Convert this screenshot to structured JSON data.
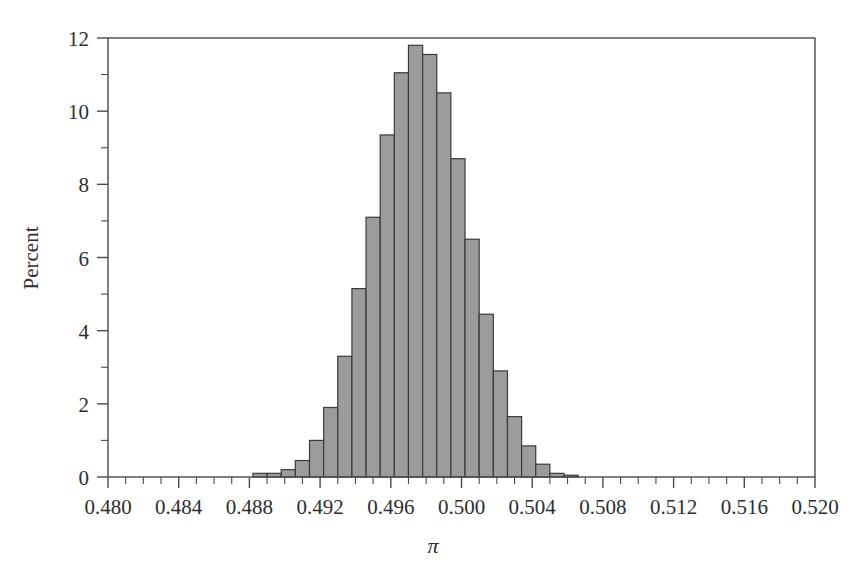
{
  "figure": {
    "background_color": "#ffffff",
    "plot_frame_color": "#4a4a4a",
    "bar_fill_color": "#9c9c9c",
    "bar_edge_color": "#3a3a3a",
    "text_color": "#2e2e2e"
  },
  "chart_data": {
    "type": "bar",
    "title": "",
    "subtitle": "",
    "xlabel": "π",
    "ylabel": "Percent",
    "xlim": [
      0.48,
      0.52
    ],
    "ylim": [
      0,
      12.2
    ],
    "grid": false,
    "legend": null,
    "bin_width": 0.0008,
    "x_major_ticks": [
      0.48,
      0.484,
      0.488,
      0.492,
      0.496,
      0.5,
      0.504,
      0.508,
      0.512,
      0.516,
      0.52
    ],
    "x_major_tick_labels": [
      "0.480",
      "0.484",
      "0.488",
      "0.492",
      "0.496",
      "0.500",
      "0.504",
      "0.508",
      "0.512",
      "0.516",
      "0.520"
    ],
    "x_minor_tick_step": 0.001,
    "y_major_ticks": [
      0,
      2,
      4,
      6,
      8,
      10,
      12
    ],
    "y_major_tick_labels": [
      "0",
      "2",
      "4",
      "6",
      "8",
      "10",
      "12"
    ],
    "bin_left_edges": [
      0.4882,
      0.489,
      0.4898,
      0.4906,
      0.4914,
      0.4922,
      0.493,
      0.4938,
      0.4946,
      0.4954,
      0.4962,
      0.497,
      0.4978,
      0.4986,
      0.4994,
      0.5002,
      0.501,
      0.5018,
      0.5026,
      0.5034,
      0.5042,
      0.505,
      0.5058,
      0.5066,
      0.5074,
      0.5082,
      0.509,
      0.5098,
      0.5106
    ],
    "categories": [
      "0.4882",
      "0.4890",
      "0.4898",
      "0.4906",
      "0.4914",
      "0.4922",
      "0.4930",
      "0.4938",
      "0.4946",
      "0.4954",
      "0.4962",
      "0.4970",
      "0.4978",
      "0.4986",
      "0.4994",
      "0.5002",
      "0.5010",
      "0.5018",
      "0.5026",
      "0.5034",
      "0.5042",
      "0.5050",
      "0.5058",
      "0.5066",
      "0.5074",
      "0.5082",
      "0.5090",
      "0.5098",
      "0.5106"
    ],
    "values": [
      0.1,
      0.1,
      0.2,
      0.45,
      1.0,
      1.9,
      3.3,
      5.15,
      7.1,
      9.35,
      11.05,
      11.8,
      11.55,
      10.5,
      8.7,
      6.5,
      4.45,
      2.9,
      1.65,
      0.85,
      0.35,
      0.1,
      0.05,
      0.0,
      0.0,
      0.0,
      0.0,
      0.0,
      0.0
    ]
  }
}
